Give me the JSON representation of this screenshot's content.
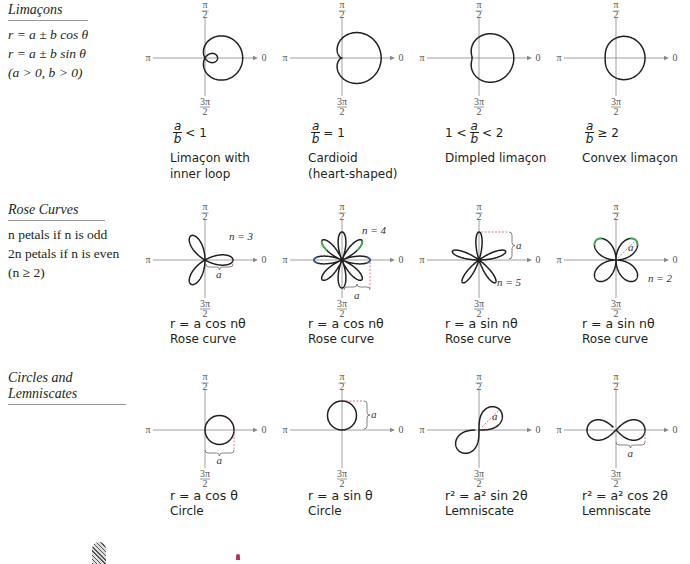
{
  "sections": [
    {
      "title": "Limaçons",
      "lines": [
        "r = a ± b cos θ",
        "r = a ± b sin θ",
        "(a > 0, b > 0)"
      ]
    },
    {
      "title": "Rose Curves",
      "lines": [
        "n petals if n is odd",
        "2n petals if n is even",
        "(n ≥ 2)"
      ]
    },
    {
      "title": "Circles and Lemniscates",
      "lines": []
    }
  ],
  "axis_labels": {
    "top": "π/2",
    "left": "π",
    "right": "0",
    "bottom": "3π/2"
  },
  "colors": {
    "curve": "#231f20",
    "axis": "#888888",
    "dimension": "#d9547a",
    "green_highlight": "#3ab54a",
    "blue_highlight": "#3a55a6"
  },
  "limacons": [
    {
      "condition_prefix": "",
      "condition_suffix": "< 1",
      "caption": [
        "Limaçon with",
        "inner loop"
      ],
      "a": 0.5,
      "b": 1
    },
    {
      "condition_prefix": "",
      "condition_suffix": "= 1",
      "caption": [
        "Cardioid",
        "(heart-shaped)"
      ],
      "a": 1,
      "b": 1
    },
    {
      "condition_prefix": "1 <",
      "condition_suffix": "< 2",
      "caption": [
        "Dimpled limaçon",
        ""
      ],
      "a": 1.5,
      "b": 1
    },
    {
      "condition_prefix": "",
      "condition_suffix": "≥ 2",
      "caption": [
        "Convex limaçon",
        ""
      ],
      "a": 2.2,
      "b": 1
    }
  ],
  "roses": [
    {
      "equation": "r = a cos nθ",
      "caption": "Rose curve",
      "n": 3,
      "fn": "cos",
      "label": "n = 3",
      "dim_label": "a"
    },
    {
      "equation": "r = a cos nθ",
      "caption": "Rose curve",
      "n": 4,
      "fn": "cos",
      "label": "n = 4",
      "dim_label": "a"
    },
    {
      "equation": "r = a sin nθ",
      "caption": "Rose curve",
      "n": 5,
      "fn": "sin",
      "label": "n = 5",
      "dim_label": "a"
    },
    {
      "equation": "r = a sin nθ",
      "caption": "Rose curve",
      "n": 2,
      "fn": "sin",
      "label": "n = 2",
      "dim_label": "a"
    }
  ],
  "circles_lemniscates": [
    {
      "equation": "r = a cos θ",
      "caption": "Circle",
      "kind": "circle-cos",
      "dim_label": "a"
    },
    {
      "equation": "r = a sin θ",
      "caption": "Circle",
      "kind": "circle-sin",
      "dim_label": "a"
    },
    {
      "equation": "r² = a² sin 2θ",
      "caption": "Lemniscate",
      "kind": "lem-sin",
      "dim_label": "a"
    },
    {
      "equation": "r² = a² cos 2θ",
      "caption": "Lemniscate",
      "kind": "lem-cos",
      "dim_label": "a"
    }
  ],
  "limacon_fraction": {
    "num": "a",
    "den": "b"
  }
}
